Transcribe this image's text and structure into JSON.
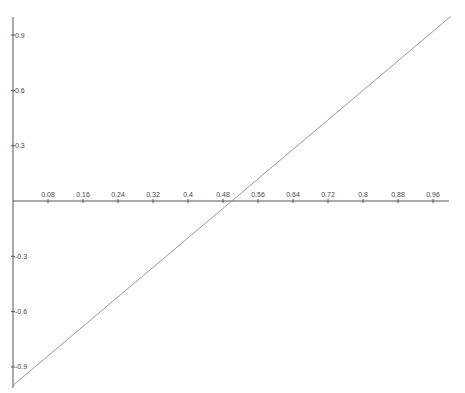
{
  "chart_data": {
    "type": "line",
    "title": "",
    "xlabel": "",
    "ylabel": "",
    "xlim": [
      0,
      1
    ],
    "ylim": [
      -1,
      1
    ],
    "grid": false,
    "legend": "none",
    "x_ticks": [
      0.08,
      0.16,
      0.24,
      0.32,
      0.4,
      0.48,
      0.56,
      0.64,
      0.72,
      0.8,
      0.88,
      0.96
    ],
    "x_tick_labels": [
      "0.08",
      "0.16",
      "0.24",
      "0.32",
      "0.4",
      "0.48",
      "0.56",
      "0.64",
      "0.72",
      "0.8",
      "0.88",
      "0.96"
    ],
    "y_ticks": [
      0.9,
      0.6,
      0.3,
      -0.3,
      -0.6,
      -0.9
    ],
    "y_tick_labels": [
      "0.9",
      "0.6",
      "0.3",
      "-0.3",
      "-0.6",
      "-0.9"
    ],
    "series": [
      {
        "name": "y = 2x - 1",
        "color": "#9a9a9a",
        "x": [
          0,
          1
        ],
        "y": [
          -1,
          1
        ]
      }
    ],
    "axis_color": "#555555"
  }
}
